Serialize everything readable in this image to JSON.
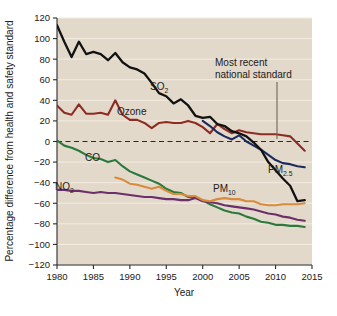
{
  "chart_data": {
    "type": "line",
    "title": "",
    "xlabel": "Year",
    "ylabel": "Percentage difference from health and safety standard",
    "xlim": [
      1980,
      2015
    ],
    "ylim": [
      -120,
      120
    ],
    "xticks": [
      1980,
      1985,
      1990,
      1995,
      2000,
      2005,
      2010,
      2015
    ],
    "yticks": [
      120,
      100,
      80,
      60,
      40,
      20,
      0,
      -20,
      -40,
      -60,
      -80,
      -100,
      -120
    ],
    "xtick_labels": [
      "1980",
      "1985",
      "1990",
      "1995",
      "2000",
      "2005",
      "2010",
      "2015"
    ],
    "ytick_labels": [
      "120",
      "100",
      "80",
      "60",
      "40",
      "20",
      "0",
      "−20",
      "−40",
      "−60",
      "−80",
      "−100",
      "−120"
    ],
    "grid": "horizontal-white",
    "legend": "inline-labels",
    "plot_background": "#e2d9cb",
    "reference_line": {
      "value": 0,
      "style": "dashed",
      "color": "#3a332a",
      "label": "Most recent national standard"
    },
    "annotations": [
      {
        "text_line1": "Most recent",
        "text_line2": "national standard",
        "points_to": "zero-reference-line",
        "year": 2009
      }
    ],
    "series": [
      {
        "name": "SO2",
        "label": "SO",
        "label_sub": "2",
        "color": "#121212",
        "x": [
          1980,
          1981,
          1982,
          1983,
          1984,
          1985,
          1986,
          1987,
          1988,
          1989,
          1990,
          1991,
          1992,
          1993,
          1994,
          1995,
          1996,
          1997,
          1998,
          1999,
          2000,
          2001,
          2002,
          2003,
          2004,
          2005,
          2006,
          2007,
          2008,
          2009,
          2010,
          2011,
          2012,
          2013,
          2014
        ],
        "values": [
          113,
          97,
          82,
          97,
          85,
          87,
          85,
          79,
          86,
          77,
          72,
          70,
          66,
          57,
          47,
          44,
          37,
          41,
          35,
          25,
          23,
          24,
          17,
          15,
          10,
          8,
          5,
          -1,
          -8,
          -20,
          -28,
          -36,
          -43,
          -58,
          -57
        ]
      },
      {
        "name": "Ozone",
        "label": "Ozone",
        "label_sub": "",
        "color": "#8e2c24",
        "x": [
          1980,
          1981,
          1982,
          1983,
          1984,
          1985,
          1986,
          1987,
          1988,
          1989,
          1990,
          1991,
          1992,
          1993,
          1994,
          1995,
          1996,
          1997,
          1998,
          1999,
          2000,
          2001,
          2002,
          2003,
          2004,
          2005,
          2006,
          2007,
          2008,
          2009,
          2010,
          2011,
          2012,
          2013,
          2014
        ],
        "values": [
          35,
          28,
          26,
          36,
          27,
          27,
          28,
          26,
          40,
          26,
          21,
          21,
          18,
          13,
          18,
          19,
          18,
          18,
          20,
          18,
          14,
          8,
          17,
          12,
          8,
          11,
          9,
          8,
          7,
          7,
          7,
          6,
          5,
          -2,
          -9
        ]
      },
      {
        "name": "CO",
        "label": "CO",
        "label_sub": "",
        "color": "#2b7a3c",
        "x": [
          1980,
          1981,
          1982,
          1983,
          1984,
          1985,
          1986,
          1987,
          1988,
          1989,
          1990,
          1991,
          1992,
          1993,
          1994,
          1995,
          1996,
          1997,
          1998,
          1999,
          2000,
          2001,
          2002,
          2003,
          2004,
          2005,
          2006,
          2007,
          2008,
          2009,
          2010,
          2011,
          2012,
          2013,
          2014
        ],
        "values": [
          1,
          -4,
          -6,
          -9,
          -13,
          -16,
          -17,
          -20,
          -18,
          -24,
          -29,
          -32,
          -35,
          -38,
          -41,
          -46,
          -49,
          -50,
          -54,
          -54,
          -57,
          -61,
          -64,
          -67,
          -69,
          -70,
          -73,
          -75,
          -78,
          -79,
          -81,
          -81,
          -82,
          -82,
          -83
        ]
      },
      {
        "name": "NO2",
        "label": "NO",
        "label_sub": "2",
        "color": "#6b2f6b",
        "x": [
          1980,
          1981,
          1982,
          1983,
          1984,
          1985,
          1986,
          1987,
          1988,
          1989,
          1990,
          1991,
          1992,
          1993,
          1994,
          1995,
          1996,
          1997,
          1998,
          1999,
          2000,
          2001,
          2002,
          2003,
          2004,
          2005,
          2006,
          2007,
          2008,
          2009,
          2010,
          2011,
          2012,
          2013,
          2014
        ],
        "values": [
          -47,
          -47,
          -48,
          -48,
          -49,
          -50,
          -49,
          -50,
          -50,
          -51,
          -52,
          -53,
          -54,
          -54,
          -55,
          -56,
          -56,
          -57,
          -57,
          -55,
          -58,
          -59,
          -60,
          -62,
          -63,
          -64,
          -65,
          -66,
          -68,
          -70,
          -71,
          -73,
          -74,
          -76,
          -77
        ]
      },
      {
        "name": "PM10",
        "label": "PM",
        "label_sub": "10",
        "color": "#d98b3a",
        "x": [
          1988,
          1989,
          1990,
          1991,
          1992,
          1993,
          1994,
          1995,
          1996,
          1997,
          1998,
          1999,
          2000,
          2001,
          2002,
          2003,
          2004,
          2005,
          2006,
          2007,
          2008,
          2009,
          2010,
          2011,
          2012,
          2013,
          2014
        ],
        "values": [
          -35,
          -37,
          -41,
          -42,
          -44,
          -46,
          -44,
          -48,
          -51,
          -51,
          -53,
          -53,
          -57,
          -58,
          -56,
          -55,
          -56,
          -56,
          -58,
          -58,
          -61,
          -62,
          -62,
          -61,
          -61,
          -61,
          -60
        ]
      },
      {
        "name": "PM2.5",
        "label": "PM",
        "label_sub": "2.5",
        "color": "#1b2b5e",
        "x": [
          2000,
          2001,
          2002,
          2003,
          2004,
          2005,
          2006,
          2007,
          2008,
          2009,
          2010,
          2011,
          2012,
          2013,
          2014
        ],
        "values": [
          20,
          15,
          9,
          5,
          2,
          6,
          0,
          -4,
          -8,
          -13,
          -18,
          -21,
          -22,
          -24,
          -25
        ]
      }
    ]
  },
  "labels": {
    "so2": {
      "main": "SO",
      "sub": "2"
    },
    "ozone": {
      "main": "Ozone",
      "sub": ""
    },
    "co": {
      "main": "CO",
      "sub": ""
    },
    "no2": {
      "main": "NO",
      "sub": "2"
    },
    "pm10": {
      "main": "PM",
      "sub": "10"
    },
    "pm25": {
      "main": "PM",
      "sub": "2.5"
    }
  },
  "annotation": {
    "line1": "Most recent",
    "line2": "national standard"
  },
  "axes": {
    "x_title": "Year",
    "y_title": "Percentage difference from health and safety standard"
  }
}
